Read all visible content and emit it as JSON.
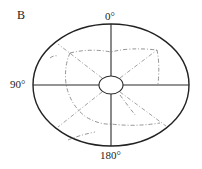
{
  "figure": {
    "panel_label": "B",
    "angle_labels": {
      "top": "0°",
      "left": "90°",
      "bottom": "180°"
    },
    "colors": {
      "outline": "#222222",
      "axis": "#2a2a2a",
      "guide": "#8a8a8a",
      "contour": "#777777",
      "background": "#ffffff"
    }
  }
}
